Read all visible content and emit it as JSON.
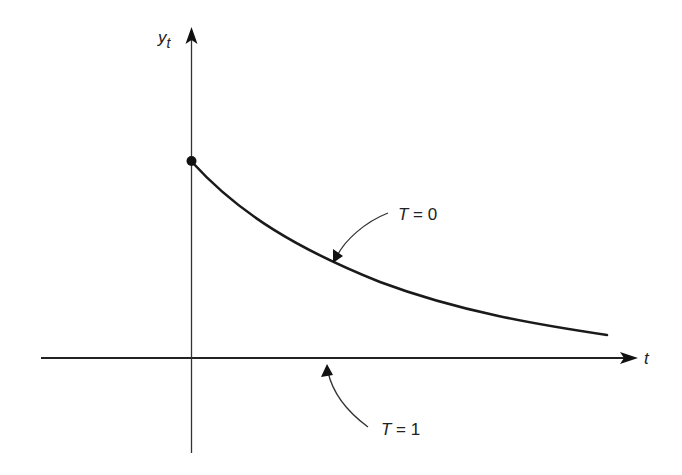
{
  "diagram": {
    "axes": {
      "y_label": "y",
      "y_subscript": "t",
      "x_label": "t"
    },
    "curves": [
      {
        "name": "decay-curve",
        "label": "T = 0",
        "label_var": "T",
        "label_rest": " = 0"
      },
      {
        "name": "flat-axis-curve",
        "label": "T = 1",
        "label_var": "T",
        "label_rest": " = 1"
      }
    ],
    "initial_point": {
      "description": "filled dot at y-intercept"
    },
    "colors": {
      "line": "#1a1a1a",
      "axis": "#333333"
    }
  }
}
